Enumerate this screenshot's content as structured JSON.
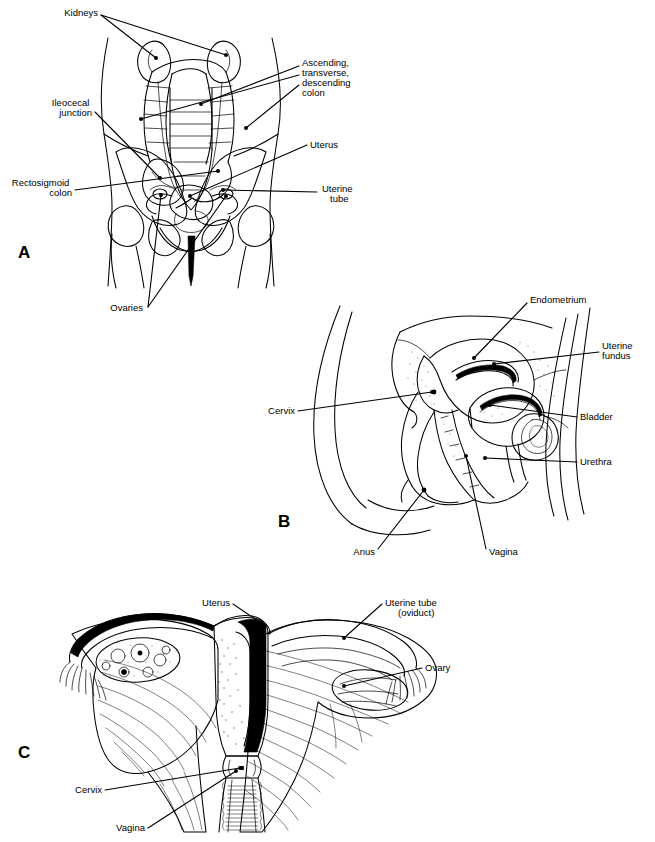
{
  "figure": {
    "background_color": "#ffffff",
    "line_color": "#000000",
    "label_font_size_px": 9.5,
    "panels": [
      {
        "letter": "A",
        "name": "anterior-abdominopelvic-view",
        "description": "Anterior view of abdomen and pelvis showing kidneys, colon and female pelvic organs in relation to the skeleton",
        "labels": [
          {
            "id": "kidneys",
            "text": "Kidneys",
            "lines": [
              "Kidneys"
            ],
            "align": "end",
            "x": 98,
            "y": 16
          },
          {
            "id": "ascending-colon",
            "text": "Ascending, transverse, descending colon",
            "lines": [
              "Ascending,",
              "transverse,",
              "descending",
              "colon"
            ],
            "align": "start",
            "x": 302,
            "y": 66
          },
          {
            "id": "ileocecal",
            "text": "Ileocecal junction",
            "lines": [
              "Ileocecal",
              "junction"
            ],
            "align": "end",
            "x": 92,
            "y": 106
          },
          {
            "id": "uterus",
            "text": "Uterus",
            "lines": [
              "Uterus"
            ],
            "align": "start",
            "x": 310,
            "y": 145
          },
          {
            "id": "rectosigmoid",
            "text": "Rectosigmoid colon",
            "lines": [
              "Rectosigmoid",
              "colon"
            ],
            "align": "end",
            "x": 72,
            "y": 186
          },
          {
            "id": "uterine-tube",
            "text": "Uterine tube",
            "lines": [
              "Uterine",
              "tube"
            ],
            "align": "start",
            "x": 320,
            "y": 192
          },
          {
            "id": "ovaries",
            "text": "Ovaries",
            "lines": [
              "Ovaries"
            ],
            "align": "end",
            "x": 143,
            "y": 310
          }
        ]
      },
      {
        "letter": "B",
        "name": "midsagittal-section-view",
        "description": "Midsagittal section of the female pelvis showing uterus, bladder, vagina and rectum",
        "labels": [
          {
            "id": "endometrium",
            "text": "Endometrium",
            "lines": [
              "Endometrium"
            ],
            "align": "start",
            "x": 530,
            "y": 303
          },
          {
            "id": "uterine-fundus",
            "text": "Uterine fundus",
            "lines": [
              "Uterine",
              "fundus"
            ],
            "align": "start",
            "x": 602,
            "y": 349
          },
          {
            "id": "cervix",
            "text": "Cervix",
            "lines": [
              "Cervix"
            ],
            "align": "end",
            "x": 295,
            "y": 410
          },
          {
            "id": "bladder",
            "text": "Bladder",
            "lines": [
              "Bladder"
            ],
            "align": "start",
            "x": 580,
            "y": 417
          },
          {
            "id": "urethra",
            "text": "Urethra",
            "lines": [
              "Urethra"
            ],
            "align": "start",
            "x": 580,
            "y": 462
          },
          {
            "id": "anus",
            "text": "Anus",
            "lines": [
              "Anus"
            ],
            "align": "end",
            "x": 375,
            "y": 552
          },
          {
            "id": "vagina",
            "text": "Vagina",
            "lines": [
              "Vagina"
            ],
            "align": "start",
            "x": 489,
            "y": 552
          }
        ]
      },
      {
        "letter": "C",
        "name": "posterior-uterus-dissection-view",
        "description": "Posterior view of uterus, uterine tubes, ovaries and vagina with broad ligament and a sectioned ovary",
        "labels": [
          {
            "id": "uterus",
            "text": "Uterus",
            "lines": [
              "Uterus"
            ],
            "align": "end",
            "x": 230,
            "y": 603
          },
          {
            "id": "uterine-tube",
            "text": "Uterine tube (oviduct)",
            "lines": [
              "Uterine tube",
              "(oviduct)"
            ],
            "align": "start",
            "x": 385,
            "y": 603
          },
          {
            "id": "ovary",
            "text": "Ovary",
            "lines": [
              "Ovary"
            ],
            "align": "start",
            "x": 425,
            "y": 668
          },
          {
            "id": "cervix",
            "text": "Cervix",
            "lines": [
              "Cervix"
            ],
            "align": "end",
            "x": 102,
            "y": 793
          },
          {
            "id": "vagina",
            "text": "Vagina",
            "lines": [
              "Vagina"
            ],
            "align": "end",
            "x": 145,
            "y": 831
          }
        ]
      }
    ]
  }
}
